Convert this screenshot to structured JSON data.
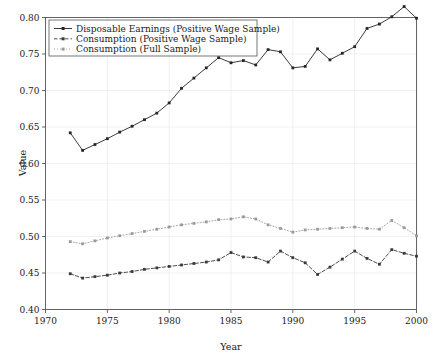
{
  "chart_data": {
    "type": "line",
    "title": "",
    "xlabel": "Year",
    "ylabel": "Value",
    "xlim": [
      1970,
      2000
    ],
    "ylim": [
      0.4,
      0.8
    ],
    "grid": true,
    "legend_position": "top-left",
    "xticks": [
      1970,
      1975,
      1980,
      1985,
      1990,
      1995,
      2000
    ],
    "xtick_labels": [
      "1970",
      "1975",
      "1980",
      "1985",
      "1990",
      "1995",
      "2000"
    ],
    "yticks": [
      0.4,
      0.45,
      0.5,
      0.55,
      0.6,
      0.65,
      0.7,
      0.75,
      0.8
    ],
    "ytick_labels": [
      "0.40",
      "0.45",
      "0.50",
      "0.55",
      "0.60",
      "0.65",
      "0.70",
      "0.75",
      "0.80"
    ],
    "x": [
      1972,
      1973,
      1974,
      1975,
      1976,
      1977,
      1978,
      1979,
      1980,
      1981,
      1982,
      1983,
      1984,
      1985,
      1986,
      1987,
      1988,
      1989,
      1990,
      1991,
      1992,
      1993,
      1994,
      1995,
      1996,
      1997,
      1998,
      1999,
      2000
    ],
    "series": [
      {
        "name": "Disposable Earnings (Positive Wage Sample)",
        "color": "#262626",
        "linestyle": "solid",
        "marker": "square",
        "values": [
          0.642,
          0.618,
          0.626,
          0.634,
          0.643,
          0.651,
          0.66,
          0.669,
          0.683,
          0.703,
          0.717,
          0.731,
          0.745,
          0.738,
          0.741,
          0.735,
          0.756,
          0.753,
          0.731,
          0.733,
          0.757,
          0.742,
          0.751,
          0.76,
          0.785,
          0.791,
          0.801,
          0.815,
          0.799
        ]
      },
      {
        "name": "Consumption (Positive Wage Sample)",
        "color": "#3a3a3a",
        "linestyle": "dashed",
        "marker": "square",
        "values": [
          0.449,
          0.443,
          0.445,
          0.447,
          0.45,
          0.452,
          0.455,
          0.457,
          0.459,
          0.461,
          0.463,
          0.465,
          0.468,
          0.478,
          0.472,
          0.471,
          0.465,
          0.48,
          0.471,
          0.464,
          0.448,
          0.458,
          0.469,
          0.48,
          0.47,
          0.462,
          0.482,
          0.477,
          0.473
        ]
      },
      {
        "name": "Consumption (Full Sample)",
        "color": "#9a9a9a",
        "linestyle": "dotted",
        "marker": "square",
        "values": [
          0.493,
          0.49,
          0.494,
          0.498,
          0.501,
          0.504,
          0.507,
          0.51,
          0.513,
          0.516,
          0.518,
          0.52,
          0.523,
          0.524,
          0.527,
          0.524,
          0.516,
          0.511,
          0.506,
          0.509,
          0.51,
          0.511,
          0.512,
          0.513,
          0.511,
          0.51,
          0.522,
          0.512,
          0.501
        ]
      }
    ]
  }
}
